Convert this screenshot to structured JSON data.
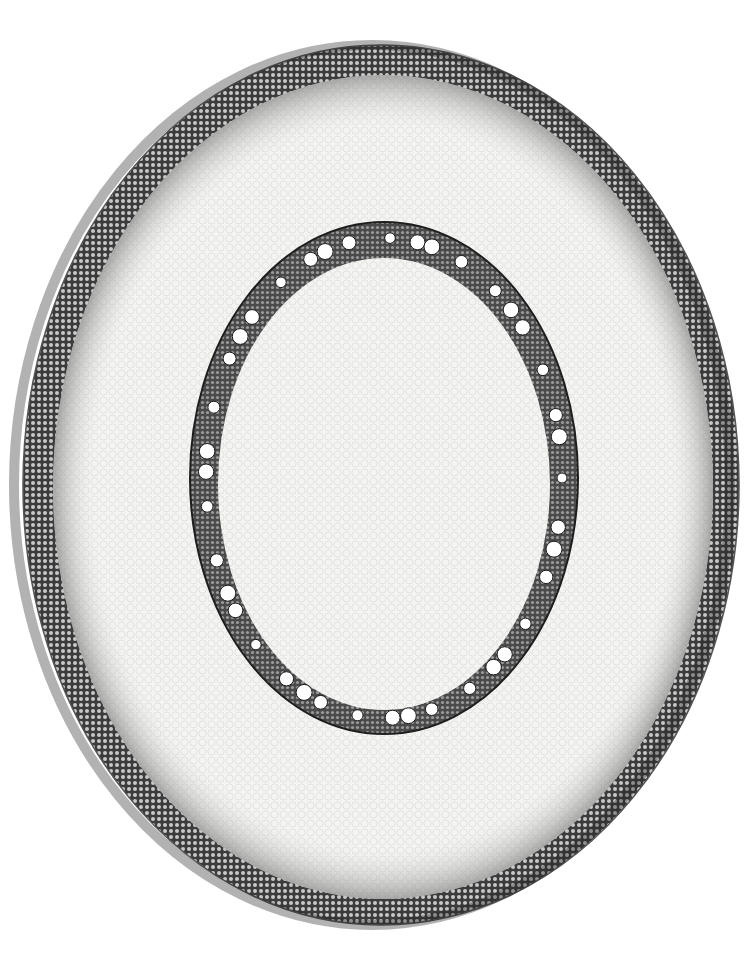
{
  "image": {
    "subject": "Transverse section of a monocot root (light micrograph)",
    "width": 756,
    "height": 968,
    "colors": {
      "background": "#ffffff",
      "tissue_light": "#f3f3f1",
      "cortex_cells": "#d9d9d6",
      "epidermis_dark": "#2e2e2e",
      "stele_band": "#3a3a3a",
      "vessel_lumen": "#ffffff"
    },
    "regions": [
      {
        "name": "epidermis-exodermis",
        "shape": "ellipse",
        "cx": 381,
        "cy": 485,
        "rx": 358,
        "ry": 440
      },
      {
        "name": "cortex",
        "shape": "ellipse",
        "cx": 381,
        "cy": 487,
        "rx": 330,
        "ry": 412
      },
      {
        "name": "endodermis-pericycle-ring",
        "shape": "ellipse",
        "cx": 384,
        "cy": 478,
        "rx": 194,
        "ry": 256
      },
      {
        "name": "pith",
        "shape": "ellipse",
        "cx": 384,
        "cy": 482,
        "rx": 165,
        "ry": 226
      }
    ],
    "vessel_count": 40
  }
}
